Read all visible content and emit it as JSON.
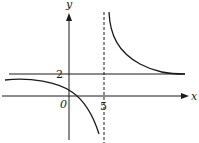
{
  "diagram": {
    "type": "function-graph",
    "axes": {
      "x_label": "x",
      "y_label": "y",
      "origin_label": "0"
    },
    "asymptotes": {
      "horizontal": {
        "value": 2,
        "label": "2",
        "style": "solid"
      },
      "vertical": {
        "value": 5,
        "label": "5",
        "style": "dashed"
      }
    },
    "branches": [
      {
        "name": "left-branch",
        "description": "approaches y=2 as x→-∞, crosses y-axis above 0, crosses x-axis just right of 0, falls to -∞ as x→5⁻"
      },
      {
        "name": "right-branch",
        "description": "rises to +∞ as x→5⁺, decreases toward y=2 as x→+∞"
      }
    ],
    "colors": {
      "stroke": "#1a1a1a"
    }
  }
}
